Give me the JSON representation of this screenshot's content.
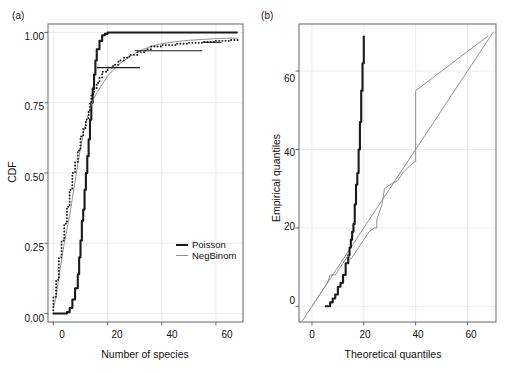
{
  "figure": {
    "panels": [
      {
        "tag": "(a)",
        "xlabel": "Number of species",
        "ylabel": "CDF",
        "xticks": [
          "0",
          "20",
          "40",
          "60"
        ],
        "yticks": [
          "0.00",
          "0.25",
          "0.50",
          "0.75",
          "1.00"
        ],
        "legend": [
          {
            "label": "Poisson",
            "color": "#1a1a1a"
          },
          {
            "label": "NegBinom",
            "color": "#8c8c8c"
          }
        ]
      },
      {
        "tag": "(b)",
        "xlabel": "Theoretical quantiles",
        "ylabel": "Empirical quantiles",
        "xticks": [
          "0",
          "20",
          "40",
          "60"
        ],
        "yticks": [
          "0",
          "20",
          "40",
          "60"
        ]
      }
    ]
  },
  "chart_data": [
    {
      "type": "line",
      "panel": "(a)",
      "title": "",
      "xlabel": "Number of species",
      "ylabel": "CDF",
      "xlim": [
        -2,
        70
      ],
      "ylim": [
        -0.03,
        1.03
      ],
      "xticks": [
        0,
        20,
        40,
        60
      ],
      "yticks": [
        0.0,
        0.25,
        0.5,
        0.75,
        1.0
      ],
      "grid": true,
      "legend_position": "bottom-right",
      "series": [
        {
          "name": "Poisson",
          "style": "step-thick-black",
          "color": "#1a1a1a",
          "x": [
            0,
            2,
            4,
            5,
            6,
            7,
            8,
            9,
            9.5,
            10,
            10.5,
            11,
            11.5,
            12,
            12.5,
            13,
            13.5,
            14,
            14.5,
            15,
            15.5,
            16,
            17,
            18,
            19,
            20,
            25,
            30,
            40,
            50,
            60,
            68
          ],
          "y": [
            0.0,
            0.0,
            0.0,
            0.005,
            0.02,
            0.05,
            0.09,
            0.14,
            0.2,
            0.26,
            0.33,
            0.37,
            0.44,
            0.5,
            0.56,
            0.62,
            0.69,
            0.75,
            0.8,
            0.85,
            0.9,
            0.94,
            0.97,
            0.99,
            0.995,
            1.0,
            1.0,
            1.0,
            1.0,
            1.0,
            1.0,
            1.0
          ]
        },
        {
          "name": "NegBinom",
          "style": "line-thin-gray",
          "color": "#8c8c8c",
          "x": [
            0,
            1,
            2,
            3,
            4,
            5,
            6,
            7,
            8,
            9,
            10,
            11,
            12,
            13,
            14,
            15,
            16,
            18,
            20,
            22,
            24,
            26,
            28,
            30,
            33,
            36,
            40,
            45,
            50,
            55,
            60,
            64,
            68
          ],
          "y": [
            0.02,
            0.06,
            0.13,
            0.19,
            0.25,
            0.3,
            0.35,
            0.41,
            0.47,
            0.53,
            0.59,
            0.64,
            0.68,
            0.71,
            0.745,
            0.765,
            0.785,
            0.815,
            0.845,
            0.865,
            0.885,
            0.9,
            0.912,
            0.925,
            0.94,
            0.95,
            0.96,
            0.967,
            0.972,
            0.975,
            0.978,
            0.979,
            0.98
          ]
        },
        {
          "name": "Empirical ECDF",
          "style": "dotted-step-black",
          "color": "#1a1a1a",
          "x": [
            0,
            0,
            1,
            2,
            3,
            4,
            5,
            6,
            7,
            8,
            9,
            10,
            11,
            12,
            13,
            13.5,
            14,
            15,
            16,
            17,
            18,
            20,
            22,
            24,
            26,
            28,
            31,
            34,
            36,
            40,
            45,
            50,
            55,
            60,
            65,
            68
          ],
          "y": [
            0.0,
            0.06,
            0.12,
            0.2,
            0.26,
            0.32,
            0.38,
            0.44,
            0.5,
            0.54,
            0.58,
            0.63,
            0.66,
            0.69,
            0.72,
            0.75,
            0.78,
            0.8,
            0.82,
            0.84,
            0.86,
            0.875,
            0.885,
            0.9,
            0.91,
            0.92,
            0.93,
            0.94,
            0.95,
            0.955,
            0.96,
            0.963,
            0.966,
            0.97,
            0.973,
            0.975
          ]
        }
      ],
      "annotations": [
        {
          "type": "horizontal-segment",
          "y": 0.875,
          "x0": 16,
          "x1": 32
        },
        {
          "type": "horizontal-segment",
          "y": 0.935,
          "x0": 30,
          "x1": 55
        },
        {
          "type": "horizontal-segment",
          "y": 0.965,
          "x0": 55,
          "x1": 62
        }
      ]
    },
    {
      "type": "line",
      "panel": "(b)",
      "title": "",
      "xlabel": "Theoretical quantiles",
      "ylabel": "Empirical quantiles",
      "xlim": [
        -5,
        71
      ],
      "ylim": [
        -4,
        72
      ],
      "xticks": [
        0,
        20,
        40,
        60
      ],
      "yticks": [
        0,
        20,
        40,
        60
      ],
      "grid": true,
      "series": [
        {
          "name": "reference-diagonal",
          "style": "line-thin-gray",
          "color": "#8c8c8c",
          "x": [
            -4,
            70
          ],
          "y": [
            -4,
            70
          ]
        },
        {
          "name": "Poisson",
          "style": "step-thick-black",
          "color": "#1a1a1a",
          "x": [
            5,
            7,
            7,
            8,
            8,
            9,
            9,
            10,
            10,
            11,
            11,
            12,
            12,
            13,
            13,
            14,
            14,
            14.5,
            15,
            15.5,
            16,
            16.5,
            17,
            17.5,
            18,
            18.5,
            19,
            19.5,
            20
          ],
          "y": [
            0,
            0,
            1,
            1,
            2,
            2,
            3,
            3,
            5,
            5,
            6,
            6,
            8,
            8,
            11,
            11,
            13,
            15,
            17,
            19,
            21,
            26,
            31,
            34,
            40,
            47,
            55,
            62,
            69
          ]
        },
        {
          "name": "NegBinom",
          "style": "line-thin-gray",
          "color": "#8c8c8c",
          "x": [
            0,
            2,
            4,
            6,
            7,
            7,
            9,
            10,
            11,
            12,
            13,
            14,
            15,
            16,
            18,
            20,
            22,
            24,
            25,
            25,
            27,
            28,
            30,
            33,
            35,
            38,
            40,
            40,
            50,
            60,
            68
          ],
          "y": [
            0,
            2,
            4,
            6,
            8,
            8,
            8,
            9,
            10,
            11,
            12,
            13,
            12,
            13,
            15,
            17,
            19,
            20,
            20,
            22,
            26,
            30,
            31,
            32,
            34,
            36,
            37,
            55,
            60,
            65,
            69
          ]
        }
      ]
    }
  ]
}
